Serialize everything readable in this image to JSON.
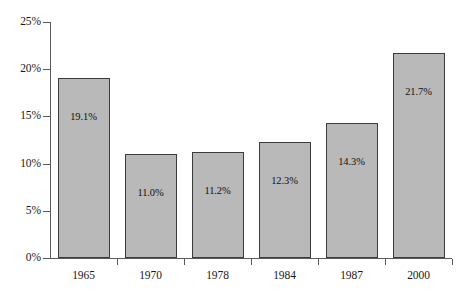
{
  "chart_data": {
    "type": "bar",
    "title": "",
    "subtitle": "",
    "xlabel": "",
    "ylabel": "",
    "categories": [
      "1965",
      "1970",
      "1978",
      "1984",
      "1987",
      "2000"
    ],
    "values": [
      19.1,
      11.0,
      11.2,
      12.3,
      14.3,
      21.7
    ],
    "value_labels": [
      "19.1%",
      "11.0%",
      "11.2%",
      "12.3%",
      "14.3%",
      "21.7%"
    ],
    "ylim": [
      0,
      25
    ],
    "ytick_values": [
      0,
      5,
      10,
      15,
      20,
      25
    ],
    "ytick_labels": [
      "0%",
      "5%",
      "10%",
      "15%",
      "20%",
      "25%"
    ],
    "grid": false,
    "legend": null,
    "legend_position": "none",
    "series": [
      {
        "name": "",
        "values": [
          19.1,
          11.0,
          11.2,
          12.3,
          14.3,
          21.7
        ]
      }
    ],
    "colors": {
      "bar_fill": "#b9b9b9",
      "bar_border": "#3c3c3c",
      "axis": "#5a5a5a",
      "text": "#1a1a1a",
      "background": "#ffffff"
    }
  }
}
